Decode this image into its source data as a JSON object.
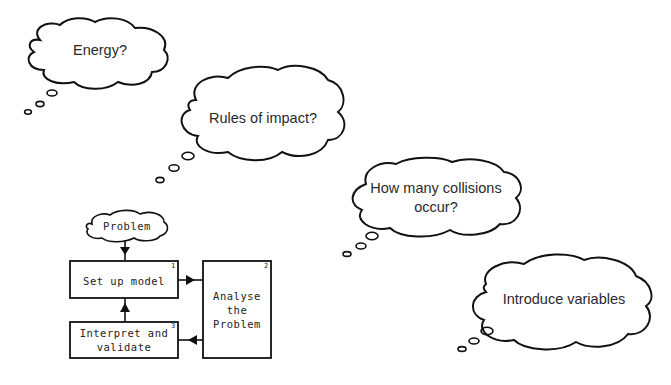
{
  "thought_clouds": [
    {
      "id": "energy",
      "text": "Energy?"
    },
    {
      "id": "rules",
      "text": "Rules of impact?"
    },
    {
      "id": "collisions",
      "lines": [
        "How many collisions",
        "occur?"
      ]
    },
    {
      "id": "variables",
      "text": "Introduce variables"
    }
  ],
  "flowchart": {
    "start": "Problem",
    "steps": [
      {
        "number": "1",
        "label": "Set up model"
      },
      {
        "number": "2",
        "lines": [
          "Analyse",
          "the",
          "Problem"
        ]
      },
      {
        "number": "3",
        "lines": [
          "Interpret and",
          "validate"
        ]
      }
    ]
  },
  "colors": {
    "stroke": "#111111",
    "text": "#2a2a2a",
    "background": "#ffffff"
  }
}
